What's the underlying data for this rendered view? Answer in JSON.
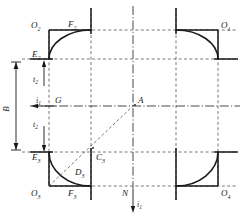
{
  "figure": {
    "colors": {
      "stroke": "#1a1a1a",
      "dashed": "#555555",
      "background": "#ffffff"
    },
    "labels": {
      "o1": {
        "base": "O",
        "sub": "1"
      },
      "o2": {
        "base": "O",
        "sub": "2"
      },
      "o3": {
        "base": "O",
        "sub": "3"
      },
      "o4": {
        "base": "O",
        "sub": "4"
      },
      "e2": {
        "base": "E",
        "sub": "2"
      },
      "e3": {
        "base": "E",
        "sub": "3"
      },
      "f2": {
        "base": "F",
        "sub": "2"
      },
      "f3": {
        "base": "F",
        "sub": "3"
      },
      "c3": {
        "base": "C",
        "sub": "3"
      },
      "d3": {
        "base": "D",
        "sub": "3"
      },
      "g": {
        "base": "G",
        "sub": ""
      },
      "a": {
        "base": "A",
        "sub": ""
      },
      "n": {
        "base": "N",
        "sub": ""
      },
      "b": {
        "base": "B",
        "sub": ""
      },
      "t2_upper": {
        "base": "t",
        "sub": "2"
      },
      "t2_lower": {
        "base": "t",
        "sub": "2"
      },
      "i1_left": {
        "base": "i",
        "sub": "1"
      },
      "i1_bottom": {
        "base": "i",
        "sub": "1"
      }
    },
    "dimensions": {
      "b_label": "B",
      "b_description": "overall vertical span between upper and lower horizontal reference lines"
    },
    "arrows": {
      "t2_upper_direction": "up",
      "t2_lower_direction": "down",
      "i1_left_direction": "left",
      "i1_bottom_direction": "down"
    },
    "elements": {
      "arc_count": 4,
      "arc_description": "quarter-circle fillet at each of the four corners",
      "diagonal": "dashed line from O3 through D3 and C3 to A",
      "centerline": "horizontal dash-dot centerline through G and A",
      "vertical_centerline": "vertical dash-dot line through A and N"
    }
  }
}
